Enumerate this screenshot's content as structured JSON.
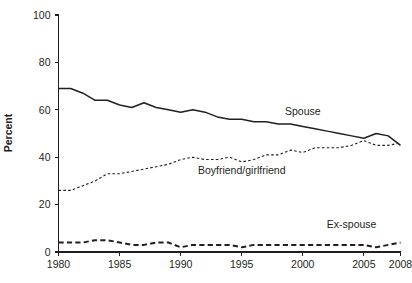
{
  "chart_data": {
    "type": "line",
    "title": "",
    "xlabel": "",
    "ylabel": "Percent",
    "xlim": [
      1980,
      2008
    ],
    "ylim": [
      0,
      100
    ],
    "grid": false,
    "legend_position": "inline-annotations",
    "x": [
      1980,
      1981,
      1982,
      1983,
      1984,
      1985,
      1986,
      1987,
      1988,
      1989,
      1990,
      1991,
      1992,
      1993,
      1994,
      1995,
      1996,
      1997,
      1998,
      1999,
      2000,
      2001,
      2002,
      2003,
      2004,
      2005,
      2006,
      2007,
      2008
    ],
    "x_tick_labels": [
      "1980",
      "1985",
      "1990",
      "1995",
      "2000",
      "2005",
      "2008"
    ],
    "x_tick_values": [
      1980,
      1985,
      1990,
      1995,
      2000,
      2005,
      2008
    ],
    "y_tick_labels": [
      "0",
      "20",
      "40",
      "60",
      "80",
      "100"
    ],
    "y_tick_values": [
      0,
      20,
      40,
      60,
      80,
      100
    ],
    "series": [
      {
        "name": "Spouse",
        "style": "solid",
        "label_x": 2000,
        "label_y": 58,
        "values": [
          69,
          69,
          67,
          64,
          64,
          62,
          61,
          63,
          61,
          60,
          59,
          60,
          59,
          57,
          56,
          56,
          55,
          55,
          54,
          54,
          53,
          52,
          51,
          50,
          49,
          48,
          50,
          49,
          45
        ]
      },
      {
        "name": "Boyfriend/girlfriend",
        "style": "dotted",
        "label_x": 1995,
        "label_y": 33,
        "values": [
          26,
          26,
          28,
          30,
          33,
          33,
          34,
          35,
          36,
          37,
          39,
          40,
          39,
          39,
          40,
          38,
          39,
          41,
          41,
          43,
          42,
          44,
          44,
          44,
          45,
          47,
          45,
          45,
          46
        ]
      },
      {
        "name": "Ex-spouse",
        "style": "dashed",
        "label_x": 2004,
        "label_y": 10,
        "values": [
          4,
          4,
          4,
          5,
          5,
          4,
          3,
          3,
          4,
          4,
          2,
          3,
          3,
          3,
          3,
          2,
          3,
          3,
          3,
          3,
          3,
          3,
          3,
          3,
          3,
          3,
          2,
          3,
          4
        ]
      }
    ]
  }
}
